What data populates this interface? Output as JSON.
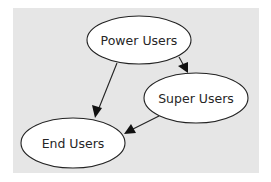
{
  "diagram": {
    "type": "directed-graph",
    "background_color": "#e6e6e6",
    "nodes": [
      {
        "id": "power",
        "label": "Power Users",
        "cx": 139,
        "cy": 40,
        "rx": 52,
        "ry": 24
      },
      {
        "id": "super",
        "label": "Super Users",
        "cx": 196,
        "cy": 98,
        "rx": 52,
        "ry": 25
      },
      {
        "id": "end",
        "label": "End Users",
        "cx": 73,
        "cy": 143,
        "rx": 52,
        "ry": 25
      }
    ],
    "edges": [
      {
        "from": "power",
        "to": "end",
        "x1": 117,
        "y1": 63,
        "x2": 95,
        "y2": 118
      },
      {
        "from": "power",
        "to": "super",
        "x1": 180,
        "y1": 58,
        "x2": 188,
        "y2": 73
      },
      {
        "from": "super",
        "to": "end",
        "x1": 158,
        "y1": 116,
        "x2": 124,
        "y2": 134
      }
    ]
  }
}
